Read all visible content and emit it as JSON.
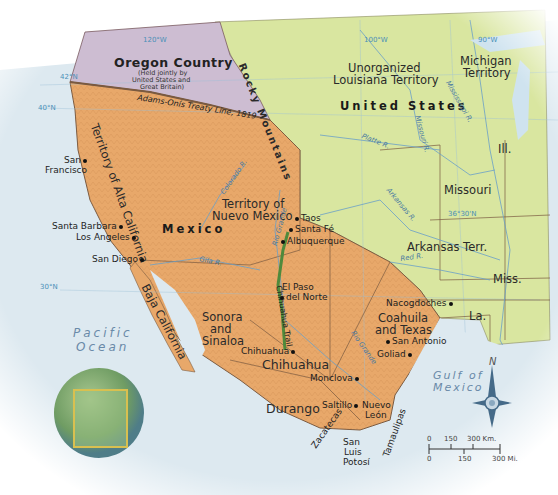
{
  "map": {
    "regions": {
      "oregon_country": "Oregon Country",
      "oregon_note_1": "(Held jointly by",
      "oregon_note_2": "United States and",
      "oregon_note_3": "Great Britain)",
      "louisiana_1": "Unorganized",
      "louisiana_2": "Louisiana Territory",
      "united_states": "United States",
      "michigan_1": "Michigan",
      "michigan_2": "Territory",
      "illinois": "Ill.",
      "missouri": "Missouri",
      "arkansas": "Arkansas Terr.",
      "mississippi": "Miss.",
      "louisiana": "La.",
      "alta_california": "Territory of Alta California",
      "nuevo_mexico_1": "Territory of",
      "nuevo_mexico_2": "Nuevo Mexico",
      "mexico": "Mexico",
      "baja_california": "Baja California",
      "sonora_1": "Sonora",
      "sonora_2": "and",
      "sonora_3": "Sinaloa",
      "chihuahua_state": "Chihuahua",
      "coahuila_1": "Coahuila",
      "coahuila_2": "and Texas",
      "durango": "Durango",
      "nuevo_leon_1": "Nuevo",
      "nuevo_leon_2": "León",
      "zacatecas": "Zacatecas",
      "slp_1": "San",
      "slp_2": "Luis",
      "slp_3": "Potosí",
      "tamaulipas": "Tamaulipas",
      "rocky_mountains": "Rocky Mountains"
    },
    "cities": {
      "san_francisco_1": "San",
      "san_francisco_2": "Francisco",
      "santa_barbara": "Santa Barbara",
      "los_angeles": "Los Angeles",
      "san_diego": "San Diego",
      "taos": "Taos",
      "santa_fe": "Santa Fé",
      "albuquerque": "Albuquerque",
      "el_paso_1": "El Paso",
      "el_paso_2": "del Norte",
      "chihuahua": "Chihuahua",
      "nacogdoches": "Nacogdoches",
      "san_antonio": "San Antonio",
      "goliad": "Goliad",
      "monclova": "Monclova",
      "saltillo": "Saltillo"
    },
    "rivers": {
      "platte": "Platte R.",
      "missouri": "Missouri R.",
      "mississippi": "Mississippi R.",
      "arkansas": "Arkansas R.",
      "red": "Red R.",
      "colorado": "Colorado R.",
      "gila": "Gila R.",
      "rio_grande": "Rio Grande"
    },
    "trails": {
      "chihuahua_trail": "Chihuahua Trail"
    },
    "lines": {
      "adams_onis": "Adams-Onís Treaty Line, 1819"
    },
    "gridlines": {
      "lat_42": "42°N",
      "lat_40": "40°N",
      "lat_30": "30°N",
      "lat_36": "36°30'N",
      "lon_120": "120°W",
      "lon_100": "100°W",
      "lon_90": "90°W"
    },
    "water": {
      "pacific_1": "Pacific",
      "pacific_2": "Ocean",
      "gulf_1": "Gulf of",
      "gulf_2": "Mexico"
    },
    "compass": {
      "north": "N"
    },
    "scale": {
      "km": [
        "0",
        "150",
        "300 Km."
      ],
      "mi": [
        "0",
        "150",
        "300 Mi."
      ]
    },
    "colors": {
      "mexico": "#e8a86a",
      "united_states": "#d9e6a0",
      "oregon": "#c9b8cf",
      "water": "#d8e8f0",
      "trail": "#4f8a3c",
      "border": "#7a5a40"
    }
  }
}
